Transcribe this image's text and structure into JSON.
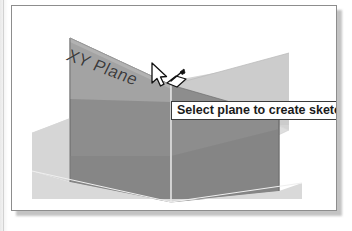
{
  "figure": {
    "kind": "cad-viewport-screenshot",
    "app_hint": "3D CAD modeling viewport"
  },
  "viewport": {
    "background_color": "#ffffff",
    "frame_border_color": "#8d8d8d"
  },
  "scene": {
    "name": "origin-planes",
    "plane_label": "XY Plane",
    "highlight_color": "#8c8c8c",
    "plane_face_color": "#8a8a8a",
    "plane_top_color": "#a9a9a9",
    "plane_light_color": "#cfcfcf",
    "ground_color": "#dcdcdc",
    "edge_color": "#6d6d6d",
    "planes": [
      {
        "name": "left-vertical-plane",
        "shading": "mid-gray"
      },
      {
        "name": "right-vertical-plane",
        "shading": "mid-gray"
      },
      {
        "name": "horizontal-ground-plane",
        "shading": "light-gray"
      }
    ]
  },
  "tooltip": {
    "text": "Select plane to create sketch or",
    "truncated": true,
    "background_color": "#ffffff",
    "border_color": "#3a3a3a",
    "text_color": "#1b1b1b"
  },
  "cursor": {
    "icon_name": "arrow-pointer-with-sketch-icon",
    "state": "hovering-plane"
  }
}
